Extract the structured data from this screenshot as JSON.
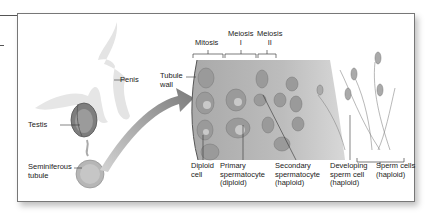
{
  "figure": {
    "labels": {
      "penis": "Penis",
      "testis": "Testis",
      "seminiferous_tubule": "Seminiferous\ntubule",
      "tubule_wall": "Tubule\nwall",
      "mitosis": "Mitosis",
      "meiosis_1": "Meiosis\nI",
      "meiosis_2": "Meiosis\nII",
      "diploid_cell": "Diploid\ncell",
      "primary_spermatocyte": "Primary\nspermatocyte\n(diploid)",
      "secondary_spermatocyte": "Secondary\nspermatocyte\n(haploid)",
      "developing_sperm": "Developing\nsperm cell\n(haploid)",
      "sperm_cells": "Sperm cells\n(haploid)"
    },
    "colors": {
      "tissue": "#b8b8b8",
      "cell": "#9a9a9a",
      "outline": "#666666",
      "arrow": "#8c8c8c"
    }
  }
}
